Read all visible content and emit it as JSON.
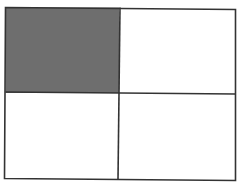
{
  "diagram": {
    "type": "area-model",
    "rows": 2,
    "cols": 2,
    "shaded_cells": [
      [
        0,
        0
      ]
    ],
    "shaded_count": 1,
    "total_parts": 4,
    "colors": {
      "shade": "#6e6e6e",
      "border": "#333333",
      "background": "#ffffff"
    },
    "geometry": {
      "x0": 5.5,
      "y0": 7.5,
      "x1": 235.5,
      "y1": 179.5,
      "vdiv_top": 120,
      "vdiv_bottom": 118,
      "hdiv_left": 92,
      "hdiv_right": 94
    }
  }
}
